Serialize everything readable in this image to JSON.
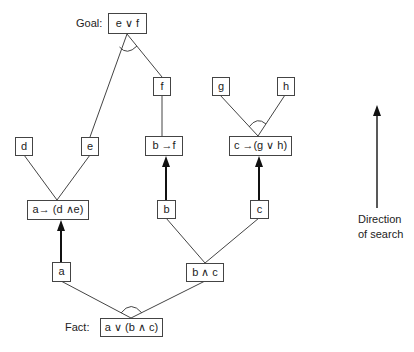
{
  "diagram": {
    "type": "and-or graph (forward chaining search)",
    "labels": {
      "goal": "Goal:",
      "fact": "Fact:"
    },
    "nodes": {
      "goal": "e ∨ f",
      "d": "d",
      "e": "e",
      "f": "f",
      "g": "g",
      "h": "h",
      "a_implies_d_and_e": "a→ (d ∧e)",
      "b_implies_f": "b →f",
      "c_implies_g_or_h": "c →(g ∨ h)",
      "a": "a",
      "b": "b",
      "c": "c",
      "b_and_c": "b ∧ c",
      "fact": "a ∨ (b ∧ c)"
    },
    "edges": [
      {
        "from": "goal",
        "to": "e",
        "type": "and-branch"
      },
      {
        "from": "goal",
        "to": "f",
        "type": "and-branch"
      },
      {
        "from": "f",
        "to": "b_implies_f",
        "type": "line"
      },
      {
        "from": "a_implies_d_and_e",
        "to": "d",
        "type": "line"
      },
      {
        "from": "a_implies_d_and_e",
        "to": "e",
        "type": "line"
      },
      {
        "from": "c_implies_g_or_h",
        "to": "g",
        "type": "and-branch"
      },
      {
        "from": "c_implies_g_or_h",
        "to": "h",
        "type": "and-branch"
      },
      {
        "from": "a",
        "to": "a_implies_d_and_e",
        "type": "arrow"
      },
      {
        "from": "b",
        "to": "b_implies_f",
        "type": "arrow"
      },
      {
        "from": "c",
        "to": "c_implies_g_or_h",
        "type": "arrow"
      },
      {
        "from": "b_and_c",
        "to": "b",
        "type": "line"
      },
      {
        "from": "b_and_c",
        "to": "c",
        "type": "line"
      },
      {
        "from": "fact",
        "to": "a",
        "type": "and-branch"
      },
      {
        "from": "fact",
        "to": "b_and_c",
        "type": "and-branch"
      }
    ],
    "direction": {
      "line1": "Direction",
      "line2": "of search"
    }
  }
}
